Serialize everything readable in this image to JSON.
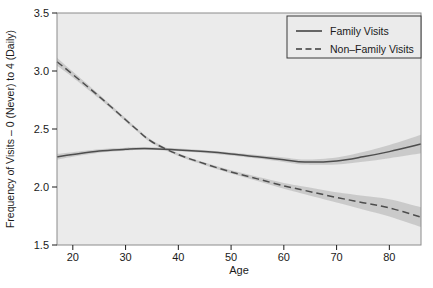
{
  "figure": {
    "background_color": "#ffffff",
    "panel_background_color": "#ebebeb",
    "panel_border_color": "#9a9a9a"
  },
  "chart_data": {
    "type": "line",
    "title": "",
    "subtitle": "",
    "xlabel": "Age",
    "ylabel": "Frequency of Visits – 0 (Never) to 4 (Daily)",
    "xlim": [
      17,
      86
    ],
    "ylim": [
      1.5,
      3.5
    ],
    "grid": false,
    "legend_position": "top-right",
    "x_ticks": [
      20,
      30,
      40,
      50,
      60,
      70,
      80
    ],
    "x_tick_labels": [
      "20",
      "30",
      "40",
      "50",
      "60",
      "70",
      "80"
    ],
    "y_ticks": [
      1.5,
      2.0,
      2.5,
      3.0,
      3.5
    ],
    "y_tick_labels": [
      "1.5",
      "2.0",
      "2.5",
      "3.0",
      "3.5"
    ],
    "x": [
      17,
      20,
      25,
      30,
      32,
      35,
      40,
      45,
      50,
      55,
      60,
      64,
      70,
      75,
      80,
      86
    ],
    "series": [
      {
        "name": "Family Visits",
        "style": "solid",
        "color": "#4d4d4d",
        "band_color": "#c4c4c4",
        "values": [
          2.26,
          2.28,
          2.31,
          2.325,
          2.33,
          2.33,
          2.32,
          2.305,
          2.285,
          2.26,
          2.235,
          2.215,
          2.225,
          2.26,
          2.305,
          2.37
        ],
        "band_lower": [
          2.235,
          2.26,
          2.295,
          2.312,
          2.318,
          2.318,
          2.308,
          2.293,
          2.272,
          2.245,
          2.216,
          2.193,
          2.195,
          2.218,
          2.248,
          2.29
        ],
        "band_upper": [
          2.285,
          2.3,
          2.325,
          2.338,
          2.342,
          2.342,
          2.332,
          2.317,
          2.298,
          2.275,
          2.254,
          2.237,
          2.255,
          2.302,
          2.362,
          2.45
        ]
      },
      {
        "name": "Non–Family Visits",
        "style": "dashed",
        "color": "#4d4d4d",
        "band_color": "#c4c4c4",
        "values": [
          3.08,
          2.97,
          2.78,
          2.58,
          2.5,
          2.39,
          2.28,
          2.2,
          2.13,
          2.07,
          2.01,
          1.97,
          1.91,
          1.865,
          1.82,
          1.74
        ],
        "band_lower": [
          3.045,
          2.945,
          2.762,
          2.565,
          2.487,
          2.377,
          2.268,
          2.188,
          2.116,
          2.052,
          1.985,
          1.938,
          1.866,
          1.806,
          1.746,
          1.655
        ],
        "band_upper": [
          3.115,
          2.995,
          2.798,
          2.595,
          2.513,
          2.403,
          2.292,
          2.212,
          2.144,
          2.088,
          2.035,
          2.002,
          1.954,
          1.924,
          1.894,
          1.825
        ]
      }
    ],
    "annotations": []
  },
  "legend": {
    "entries": [
      {
        "label": "Family Visits",
        "style": "solid"
      },
      {
        "label": "Non–Family Visits",
        "style": "dashed"
      }
    ]
  }
}
